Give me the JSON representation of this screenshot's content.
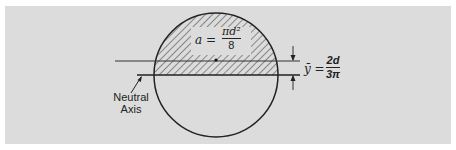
{
  "diagram": {
    "panel_background": "#dcdcdc",
    "line_color": "#222222",
    "shape": "circle",
    "shaded_region": "upper half of circle (hatched)",
    "area_label": {
      "lhs": "a =",
      "numerator": "πd²",
      "denominator": "8"
    },
    "centroid_label": {
      "lhs": "ȳ =",
      "numerator": "2d",
      "denominator": "3π"
    },
    "neutral_axis_label": {
      "line1": "Neutral",
      "line2": "Axis"
    }
  }
}
